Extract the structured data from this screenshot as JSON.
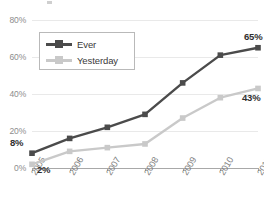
{
  "chart_data": {
    "type": "line",
    "title": "",
    "subtitle": "",
    "xlabel": "",
    "ylabel": "",
    "categories": [
      "2005",
      "2006",
      "2007",
      "2008",
      "2009",
      "2010",
      "2011"
    ],
    "x": [
      2005,
      2006,
      2007,
      2008,
      2009,
      2010,
      2011
    ],
    "ylim": [
      0,
      80
    ],
    "ytick_labels": [
      "0%",
      "20%",
      "40%",
      "60%",
      "80%"
    ],
    "ytick_values": [
      0,
      20,
      40,
      60,
      80
    ],
    "grid": "horizontal",
    "legend_position": "upper-left-inside",
    "series": [
      {
        "name": "Ever",
        "color": "#4b4b4b",
        "marker": "square",
        "values": [
          8,
          16,
          22,
          29,
          46,
          61,
          65
        ],
        "point_labels": [
          {
            "category": "2005",
            "value": 8,
            "text": "8%"
          },
          {
            "category": "2011",
            "value": 65,
            "text": "65%"
          }
        ]
      },
      {
        "name": "Yesterday",
        "color": "#c9c9c9",
        "marker": "square",
        "values": [
          2,
          9,
          11,
          13,
          27,
          38,
          43
        ],
        "point_labels": [
          {
            "category": "2005",
            "value": 2,
            "text": "2%"
          },
          {
            "category": "2011",
            "value": 43,
            "text": "43%"
          }
        ]
      }
    ],
    "annotations": [
      {
        "text": "8%",
        "series": "Ever",
        "category": "2005"
      },
      {
        "text": "2%",
        "series": "Yesterday",
        "category": "2005"
      },
      {
        "text": "65%",
        "series": "Ever",
        "category": "2011"
      },
      {
        "text": "43%",
        "series": "Yesterday",
        "category": "2011"
      }
    ]
  },
  "axes": {
    "y_ticks": [
      {
        "label": "80%",
        "value": 80
      },
      {
        "label": "60%",
        "value": 60
      },
      {
        "label": "40%",
        "value": 40
      },
      {
        "label": "20%",
        "value": 20
      },
      {
        "label": "0%",
        "value": 0
      }
    ],
    "x_ticks": [
      {
        "label": "2005"
      },
      {
        "label": "2006"
      },
      {
        "label": "2007"
      },
      {
        "label": "2008"
      },
      {
        "label": "2009"
      },
      {
        "label": "2010"
      },
      {
        "label": "2011"
      }
    ]
  },
  "legend": {
    "entries": [
      {
        "label": "Ever",
        "color": "#4b4b4b"
      },
      {
        "label": "Yesterday",
        "color": "#c9c9c9"
      }
    ]
  },
  "colors": {
    "series_ever": "#4b4b4b",
    "series_yesterday": "#c9c9c9",
    "gridline": "#e9e9e9",
    "axis": "#a8a8a8",
    "tick_text": "#8d8d8d",
    "label_text": "#2f2f2f",
    "background": "#ffffff"
  }
}
